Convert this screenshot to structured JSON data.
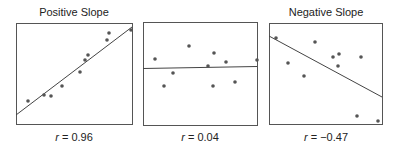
{
  "chart_data": [
    {
      "type": "scatter",
      "title": "Positive Slope",
      "annotation": "r = 0.96",
      "r_value": "0.96",
      "frame": {
        "x1": 16,
        "y1": 23,
        "x2": 132,
        "y2": 124
      },
      "points": [
        [
          28,
          101
        ],
        [
          44,
          95
        ],
        [
          51,
          96
        ],
        [
          62,
          86
        ],
        [
          80,
          72
        ],
        [
          85,
          60
        ],
        [
          88,
          55
        ],
        [
          107,
          40
        ],
        [
          109,
          33
        ],
        [
          131,
          30
        ]
      ],
      "fit_line": {
        "x1": 16,
        "y1": 115,
        "x2": 132,
        "y2": 27
      },
      "grid": false,
      "axes_ticks": false
    },
    {
      "type": "scatter",
      "title": "",
      "annotation": "r = 0.04",
      "r_value": "0.04",
      "frame": {
        "x1": 143,
        "y1": 22,
        "x2": 257,
        "y2": 125
      },
      "points": [
        [
          155,
          59
        ],
        [
          164,
          86
        ],
        [
          173,
          73
        ],
        [
          189,
          46
        ],
        [
          208,
          66
        ],
        [
          213,
          86
        ],
        [
          214,
          53
        ],
        [
          226,
          62
        ],
        [
          235,
          82
        ],
        [
          257,
          60
        ]
      ],
      "fit_line": {
        "x1": 143,
        "y1": 68.5,
        "x2": 257,
        "y2": 66.5
      },
      "grid": false,
      "axes_ticks": false
    },
    {
      "type": "scatter",
      "title": "Negative Slope",
      "annotation": "r = −0.47",
      "r_value": "−0.47",
      "frame": {
        "x1": 269,
        "y1": 23,
        "x2": 382,
        "y2": 124
      },
      "points": [
        [
          276,
          38
        ],
        [
          288,
          63
        ],
        [
          304,
          76
        ],
        [
          315,
          42
        ],
        [
          333,
          57
        ],
        [
          338,
          66
        ],
        [
          339,
          54
        ],
        [
          361,
          57
        ],
        [
          357,
          116
        ],
        [
          378,
          121
        ]
      ],
      "fit_line": {
        "x1": 269,
        "y1": 36,
        "x2": 382,
        "y2": 97
      },
      "grid": false,
      "axes_ticks": false
    }
  ],
  "panels": {
    "left": {
      "title": "Positive Slope",
      "r_symbol": "r",
      "r_eq": " = 0.96"
    },
    "middle": {
      "title": "",
      "r_symbol": "r",
      "r_eq": " = 0.04"
    },
    "right": {
      "title": "Negative Slope",
      "r_symbol": "r",
      "r_eq": " = −0.47"
    }
  }
}
